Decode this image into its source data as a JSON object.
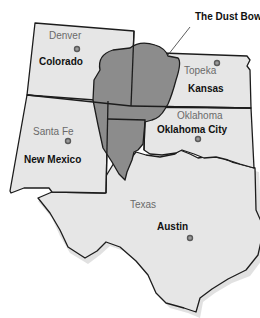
{
  "map": {
    "title": "The Dust Bowl",
    "colors": {
      "state_fill": "#e6e6e6",
      "dust_bowl_fill": "#8c8c8c",
      "border": "#1c1c1c",
      "city_dot": "#9a9a9a"
    },
    "states": [
      {
        "name": "Colorado",
        "capital": "Denver"
      },
      {
        "name": "Kansas",
        "capital": "Topeka"
      },
      {
        "name": "Oklahoma",
        "capital": "Oklahoma City"
      },
      {
        "name": "New Mexico",
        "capital": "Santa Fe"
      },
      {
        "name": "Texas",
        "capital": "Austin"
      }
    ],
    "labels": {
      "denver": "Denver",
      "colorado": "Colorado",
      "topeka": "Topeka",
      "kansas": "Kansas",
      "oklahoma": "Oklahoma",
      "oklahoma_city": "Oklahoma City",
      "santa_fe": "Santa Fe",
      "new_mexico": "New Mexico",
      "texas": "Texas",
      "austin": "Austin",
      "dust_bowl": "The Dust Bowl"
    }
  }
}
